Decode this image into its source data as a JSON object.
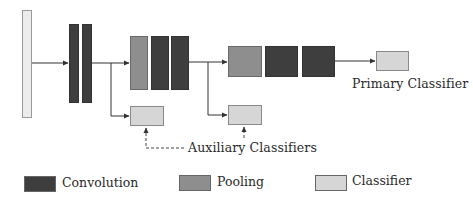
{
  "diagram": {
    "type": "neural-network-architecture",
    "colors": {
      "convolution": "#3e3e3e",
      "pooling": "#8e8e8e",
      "classifier": "#d6d6d6",
      "input": "#ececec",
      "line": "#333333"
    },
    "labels": {
      "primary_classifier": "Primary Classifier",
      "auxiliary_classifiers": "Auxiliary Classifiers"
    },
    "stages": [
      {
        "id": "input",
        "kind": "input"
      },
      {
        "id": "stage1",
        "layers": [
          "Convolution",
          "Convolution"
        ]
      },
      {
        "id": "stage2",
        "layers": [
          "Pooling",
          "Convolution",
          "Convolution"
        ],
        "auxiliary": true
      },
      {
        "id": "stage3",
        "layers": [
          "Pooling",
          "Convolution",
          "Convolution"
        ],
        "auxiliary": true
      },
      {
        "id": "primary",
        "kind": "Classifier"
      }
    ]
  },
  "legend": {
    "items": [
      {
        "label": "Convolution",
        "swatch": "conv"
      },
      {
        "label": "Pooling",
        "swatch": "pool"
      },
      {
        "label": "Classifier",
        "swatch": "cls"
      }
    ]
  }
}
